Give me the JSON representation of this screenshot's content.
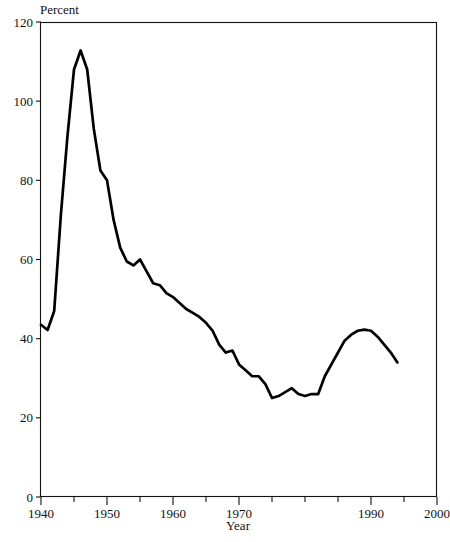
{
  "chart_data": {
    "type": "line",
    "title": "",
    "subtitle": "",
    "xlabel": "Year",
    "ylabel": "Percent",
    "ylabel_position": "above-axis-top-left",
    "xlim": [
      1940,
      2000
    ],
    "ylim": [
      0,
      120
    ],
    "grid": false,
    "legend": null,
    "legend_position": "none",
    "x_ticks_major": [
      1940,
      1950,
      1960,
      1970,
      1990,
      2000
    ],
    "x_tick_labels": [
      "1940",
      "1950",
      "1960",
      "1970",
      "1990",
      "2000"
    ],
    "x_ticks_minor": [
      1945,
      1955,
      1965,
      1975,
      1980,
      1985,
      1995
    ],
    "x_tick_labels_hidden": [
      1980
    ],
    "y_ticks": [
      0,
      20,
      40,
      60,
      80,
      100,
      120
    ],
    "y_tick_labels": [
      "0",
      "20",
      "40",
      "60",
      "80",
      "100",
      "120"
    ],
    "line_color": "#000000",
    "series": [
      {
        "name": "Percent",
        "x": [
          1940,
          1941,
          1942,
          1943,
          1944,
          1945,
          1946,
          1947,
          1948,
          1949,
          1950,
          1951,
          1952,
          1953,
          1954,
          1955,
          1956,
          1957,
          1958,
          1959,
          1960,
          1961,
          1962,
          1963,
          1964,
          1965,
          1966,
          1967,
          1968,
          1969,
          1970,
          1971,
          1972,
          1973,
          1974,
          1975,
          1976,
          1977,
          1978,
          1979,
          1980,
          1981,
          1982,
          1983,
          1984,
          1985,
          1986,
          1987,
          1988,
          1989,
          1990,
          1991,
          1992,
          1993,
          1994
        ],
        "values": [
          43.5,
          42.2,
          47.0,
          71.0,
          91.0,
          108.0,
          112.8,
          108.0,
          93.0,
          82.5,
          80.0,
          70.0,
          63.0,
          59.5,
          58.5,
          60.0,
          57.0,
          54.0,
          53.5,
          51.5,
          50.5,
          49.0,
          47.5,
          46.5,
          45.5,
          44.0,
          42.0,
          38.5,
          36.5,
          37.0,
          33.5,
          32.0,
          30.5,
          30.5,
          28.5,
          25.0,
          25.5,
          26.5,
          27.5,
          26.0,
          25.5,
          26.0,
          26.0,
          30.5,
          33.5,
          36.5,
          39.5,
          41.0,
          42.0,
          42.3,
          42.0,
          40.5,
          38.5,
          36.5,
          34.0
        ]
      }
    ]
  },
  "labels": {
    "y_axis_title": "Percent",
    "x_axis_title": "Year"
  }
}
